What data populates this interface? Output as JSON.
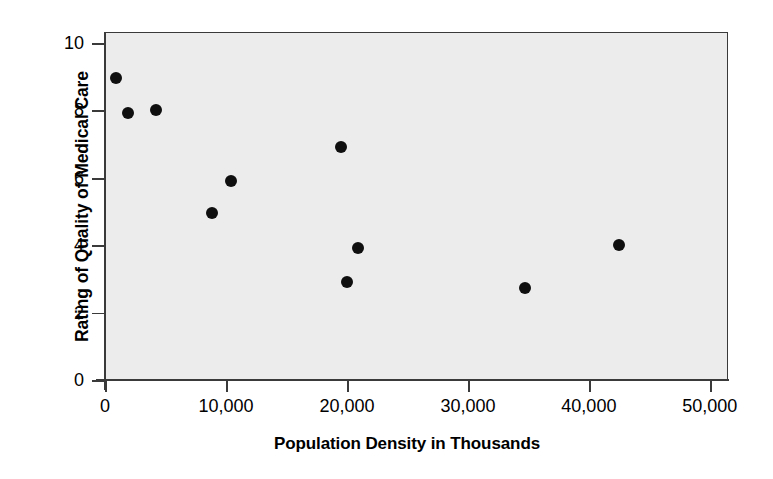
{
  "chart_data": {
    "type": "scatter",
    "title": "",
    "xlabel": "Population Density in Thousands",
    "ylabel": "Rating of Quality of Medical Care",
    "xlim": [
      0,
      51500
    ],
    "ylim": [
      0,
      10.33
    ],
    "xticks": [
      0,
      10000,
      20000,
      30000,
      40000,
      50000
    ],
    "xtick_labels": [
      "0",
      "10,000",
      "20,000",
      "30,000",
      "40,000",
      "50,000"
    ],
    "yticks": [
      0,
      2,
      4,
      6,
      8,
      10
    ],
    "ytick_labels": [
      "0",
      "2",
      "4",
      "6",
      "8",
      "10"
    ],
    "grid": false,
    "legend": null,
    "marker": "filled-circle",
    "marker_color": "#100f10",
    "plot_background": "#ececed",
    "frame_color": "#3a3a3a",
    "points": [
      {
        "x": 800,
        "y": 9.0
      },
      {
        "x": 1800,
        "y": 7.95
      },
      {
        "x": 4100,
        "y": 8.05
      },
      {
        "x": 8800,
        "y": 5.0
      },
      {
        "x": 10300,
        "y": 5.95
      },
      {
        "x": 19400,
        "y": 6.95
      },
      {
        "x": 19900,
        "y": 2.95
      },
      {
        "x": 20800,
        "y": 3.95
      },
      {
        "x": 34600,
        "y": 2.75
      },
      {
        "x": 42400,
        "y": 4.05
      }
    ]
  }
}
